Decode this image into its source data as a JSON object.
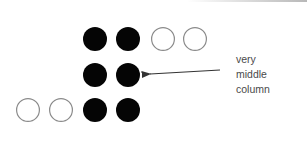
{
  "diagram": {
    "colors": {
      "filled": "#050505",
      "hollow_stroke": "#8a8a8a",
      "arrow": "#333333",
      "text": "#4a4a4a"
    },
    "circle_radius": 12,
    "rows": [
      {
        "cy": 39,
        "circles": [
          {
            "cx": 95,
            "filled": true
          },
          {
            "cx": 128,
            "filled": true
          },
          {
            "cx": 163,
            "filled": false
          },
          {
            "cx": 195,
            "filled": false
          }
        ]
      },
      {
        "cy": 75,
        "circles": [
          {
            "cx": 95,
            "filled": true
          },
          {
            "cx": 128,
            "filled": true
          }
        ]
      },
      {
        "cy": 110,
        "circles": [
          {
            "cx": 28,
            "filled": false
          },
          {
            "cx": 61,
            "filled": false
          },
          {
            "cx": 95,
            "filled": true
          },
          {
            "cx": 128,
            "filled": true
          }
        ]
      }
    ],
    "arrow": {
      "from": [
        220,
        70
      ],
      "to": [
        150,
        74
      ]
    },
    "annotation": {
      "lines": [
        "very",
        "middle",
        "column"
      ]
    }
  }
}
